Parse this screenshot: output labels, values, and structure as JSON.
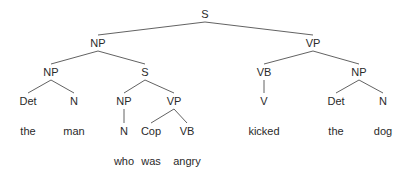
{
  "diagram": {
    "type": "syntax-tree",
    "sentence": "the man who was angry kicked the dog",
    "nodes": [
      {
        "id": "s0",
        "label": "S",
        "x": 205,
        "y": 18
      },
      {
        "id": "np1",
        "label": "NP",
        "x": 98,
        "y": 47
      },
      {
        "id": "vp1",
        "label": "VP",
        "x": 313,
        "y": 47
      },
      {
        "id": "np2",
        "label": "NP",
        "x": 51,
        "y": 76
      },
      {
        "id": "s1",
        "label": "S",
        "x": 145,
        "y": 76
      },
      {
        "id": "vb1",
        "label": "VB",
        "x": 264,
        "y": 76
      },
      {
        "id": "np3",
        "label": "NP",
        "x": 359,
        "y": 76
      },
      {
        "id": "det1",
        "label": "Det",
        "x": 28,
        "y": 105
      },
      {
        "id": "n1",
        "label": "N",
        "x": 74,
        "y": 105
      },
      {
        "id": "np4",
        "label": "NP",
        "x": 124,
        "y": 105
      },
      {
        "id": "vp2",
        "label": "VP",
        "x": 174,
        "y": 105
      },
      {
        "id": "v1",
        "label": "V",
        "x": 264,
        "y": 105
      },
      {
        "id": "det2",
        "label": "Det",
        "x": 336,
        "y": 105
      },
      {
        "id": "n2",
        "label": "N",
        "x": 383,
        "y": 105
      },
      {
        "id": "w_the1",
        "label": "the",
        "x": 28,
        "y": 135
      },
      {
        "id": "w_man",
        "label": "man",
        "x": 74,
        "y": 135
      },
      {
        "id": "n3",
        "label": "N",
        "x": 124,
        "y": 135
      },
      {
        "id": "cop",
        "label": "Cop",
        "x": 151,
        "y": 135
      },
      {
        "id": "vb2",
        "label": "VB",
        "x": 187,
        "y": 135
      },
      {
        "id": "w_kicked",
        "label": "kicked",
        "x": 264,
        "y": 135
      },
      {
        "id": "w_the2",
        "label": "the",
        "x": 336,
        "y": 135
      },
      {
        "id": "w_dog",
        "label": "dog",
        "x": 383,
        "y": 135
      },
      {
        "id": "w_who",
        "label": "who",
        "x": 124,
        "y": 165
      },
      {
        "id": "w_was",
        "label": "was",
        "x": 151,
        "y": 165
      },
      {
        "id": "w_angry",
        "label": "angry",
        "x": 187,
        "y": 165
      }
    ],
    "edges": [
      [
        "s0",
        "np1"
      ],
      [
        "s0",
        "vp1"
      ],
      [
        "np1",
        "np2"
      ],
      [
        "np1",
        "s1"
      ],
      [
        "vp1",
        "vb1"
      ],
      [
        "vp1",
        "np3"
      ],
      [
        "np2",
        "det1"
      ],
      [
        "np2",
        "n1"
      ],
      [
        "s1",
        "np4"
      ],
      [
        "s1",
        "vp2"
      ],
      [
        "vb1",
        "v1"
      ],
      [
        "np3",
        "det2"
      ],
      [
        "np3",
        "n2"
      ],
      [
        "np4",
        "n3"
      ],
      [
        "vp2",
        "cop"
      ],
      [
        "vp2",
        "vb2"
      ]
    ]
  }
}
